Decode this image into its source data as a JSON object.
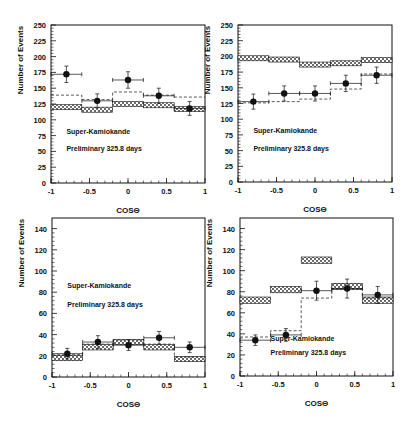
{
  "figure": {
    "width": 413,
    "height": 424,
    "colors": {
      "ink": "#111111",
      "band_fill": "#8a8a8a",
      "background": "#ffffff"
    }
  },
  "chart_data": [
    {
      "type": "bar",
      "panel": "top-left",
      "title": "",
      "xlabel": "COSΘ",
      "ylabel": "Number of Events",
      "xlim": [
        -1,
        1
      ],
      "ylim": [
        0,
        250
      ],
      "xticks": [
        "-1",
        "-0.5",
        "0",
        "0.5",
        "1"
      ],
      "yticks": [
        "0",
        "25",
        "50",
        "75",
        "100",
        "125",
        "150",
        "175",
        "200",
        "225",
        "250"
      ],
      "annotations": [
        "Super-Kamiokande",
        "Preliminary 325.8 days"
      ],
      "annotation_pos": [
        [
          0.1,
          0.31
        ],
        [
          0.1,
          0.2
        ]
      ],
      "bin_edges": [
        -1,
        -0.6,
        -0.2,
        0.2,
        0.6,
        1
      ],
      "series": [
        {
          "name": "Data",
          "style": "points",
          "x": [
            -0.8,
            -0.4,
            0.0,
            0.4,
            0.8
          ],
          "values": [
            172,
            130,
            163,
            138,
            118
          ],
          "errors": [
            13,
            11,
            13,
            12,
            11
          ]
        },
        {
          "name": "MC no oscillation",
          "style": "band",
          "values": [
            120,
            116,
            125,
            123,
            117
          ],
          "halfwidth": 4
        },
        {
          "name": "MC with oscillation",
          "style": "dashed",
          "values": [
            139,
            132,
            144,
            139,
            136
          ]
        }
      ]
    },
    {
      "type": "bar",
      "panel": "top-right",
      "title": "",
      "xlabel": "COSΘ",
      "ylabel": "Number of Events",
      "xlim": [
        -1,
        1
      ],
      "ylim": [
        0,
        250
      ],
      "xticks": [
        "-1",
        "-0.5",
        "0",
        "0.5",
        "1"
      ],
      "yticks": [
        "0",
        "25",
        "50",
        "75",
        "100",
        "125",
        "150",
        "175",
        "200",
        "225",
        "250"
      ],
      "annotations": [
        "Super-Kamiokande",
        "Preliminary 325.8 days"
      ],
      "annotation_pos": [
        [
          0.1,
          0.31
        ],
        [
          0.1,
          0.2
        ]
      ],
      "bin_edges": [
        -1,
        -0.6,
        -0.2,
        0.2,
        0.6,
        1
      ],
      "series": [
        {
          "name": "Data",
          "style": "points",
          "x": [
            -0.8,
            -0.4,
            0.0,
            0.4,
            0.8
          ],
          "values": [
            128,
            141,
            141,
            157,
            170
          ],
          "errors": [
            12,
            12,
            12,
            13,
            13
          ]
        },
        {
          "name": "MC no oscillation",
          "style": "band",
          "values": [
            197,
            195,
            187,
            189,
            194
          ],
          "halfwidth": 4
        },
        {
          "name": "MC with oscillation",
          "style": "dashed",
          "values": [
            126,
            128,
            132,
            148,
            172
          ]
        }
      ]
    },
    {
      "type": "bar",
      "panel": "bottom-left",
      "title": "",
      "xlabel": "COSΘ",
      "ylabel": "Number of Events",
      "xlim": [
        -1,
        1
      ],
      "ylim": [
        0,
        150
      ],
      "xticks": [
        "-1",
        "-0.5",
        "0",
        "0.5",
        "1"
      ],
      "yticks": [
        "0",
        "20",
        "40",
        "60",
        "80",
        "100",
        "120",
        "140"
      ],
      "annotations": [
        "Super-Kamiokande",
        "Preliminary 325.8 days"
      ],
      "annotation_pos": [
        [
          0.1,
          0.56
        ],
        [
          0.1,
          0.44
        ]
      ],
      "bin_edges": [
        -1,
        -0.6,
        -0.2,
        0.2,
        0.6,
        1
      ],
      "series": [
        {
          "name": "Data",
          "style": "points",
          "x": [
            -0.8,
            -0.4,
            0.0,
            0.4,
            0.8
          ],
          "values": [
            22,
            33,
            30,
            37,
            28
          ],
          "errors": [
            5,
            6,
            5,
            6,
            5
          ]
        },
        {
          "name": "MC no oscillation",
          "style": "band",
          "values": [
            18,
            28,
            33,
            28,
            17
          ],
          "halfwidth": 2.5
        },
        {
          "name": "MC with oscillation",
          "style": "dashed",
          "values": [
            21,
            31,
            35,
            31,
            19
          ]
        }
      ]
    },
    {
      "type": "bar",
      "panel": "bottom-right",
      "title": "",
      "xlabel": "COSΘ",
      "ylabel": "Number of Events",
      "xlim": [
        -1,
        1
      ],
      "ylim": [
        0,
        150
      ],
      "xticks": [
        "-1",
        "-0.5",
        "0",
        "0.5",
        "1"
      ],
      "yticks": [
        "0",
        "20",
        "40",
        "60",
        "80",
        "100",
        "120",
        "140"
      ],
      "annotations": [
        "Super-Kamiokande",
        "Preliminary 325.8 days"
      ],
      "annotation_pos": [
        [
          0.2,
          0.22
        ],
        [
          0.2,
          0.13
        ]
      ],
      "bin_edges": [
        -1,
        -0.6,
        -0.2,
        0.2,
        0.6,
        1
      ],
      "series": [
        {
          "name": "Data",
          "style": "points",
          "x": [
            -0.8,
            -0.4,
            0.0,
            0.4,
            0.8
          ],
          "values": [
            34,
            39,
            81,
            83,
            77
          ],
          "errors": [
            5,
            6,
            9,
            9,
            8
          ]
        },
        {
          "name": "MC no oscillation",
          "style": "band",
          "values": [
            72,
            82,
            110,
            85,
            72
          ],
          "halfwidth": 3
        },
        {
          "name": "MC with oscillation",
          "style": "dashed",
          "values": [
            37,
            43,
            74,
            83,
            74
          ]
        }
      ]
    }
  ],
  "layout": [
    {
      "left": 51,
      "right": 205,
      "top": 25,
      "bottom": 183
    },
    {
      "left": 238,
      "right": 392,
      "top": 25,
      "bottom": 182
    },
    {
      "left": 52,
      "right": 205,
      "top": 218,
      "bottom": 377
    },
    {
      "left": 240,
      "right": 393,
      "top": 218,
      "bottom": 376
    }
  ]
}
